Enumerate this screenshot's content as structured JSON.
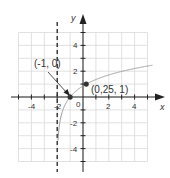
{
  "chart_data": {
    "type": "line",
    "title": "",
    "xlabel": "x",
    "ylabel": "y",
    "xlim": [
      -5,
      5
    ],
    "ylim": [
      -5,
      5
    ],
    "grid": true,
    "x_ticks": [
      -4,
      -2,
      2,
      4
    ],
    "y_ticks": [
      4,
      2,
      -2,
      -4
    ],
    "origin_label": "0",
    "function": "y = log_2.25(x + 2)",
    "asymptote": {
      "type": "vertical",
      "x": -2,
      "style": "dashed"
    },
    "series": [
      {
        "name": "curve",
        "x": [
          -1.95,
          -1.9,
          -1.8,
          -1.6,
          -1.4,
          -1.2,
          -1.0,
          -0.5,
          0,
          0.25,
          1,
          2,
          3,
          4,
          5
        ],
        "values": [
          -3.7,
          -2.84,
          -1.98,
          -1.13,
          -0.63,
          -0.28,
          0,
          0.5,
          0.85,
          1,
          1.35,
          1.71,
          1.98,
          2.21,
          2.4
        ]
      }
    ],
    "points": [
      {
        "x": -1,
        "y": 0,
        "label": "(-1, 0)"
      },
      {
        "x": 0.25,
        "y": 1,
        "label": "(0,25, 1)"
      }
    ]
  },
  "labels": {
    "x_axis": "x",
    "y_axis": "y",
    "origin": "0",
    "point_a": "(-1, 0)",
    "point_b": "(0,25, 1)",
    "xt_m4": "-4",
    "xt_m2": "-2",
    "xt_2": "2",
    "xt_4": "4",
    "yt_4": "4",
    "yt_2": "2",
    "yt_m2": "-2",
    "yt_m4": "-4"
  },
  "colors": {
    "grid": "#d9d9d9",
    "axis": "#222222",
    "curve": "#9a9a9a",
    "point": "#333333"
  }
}
